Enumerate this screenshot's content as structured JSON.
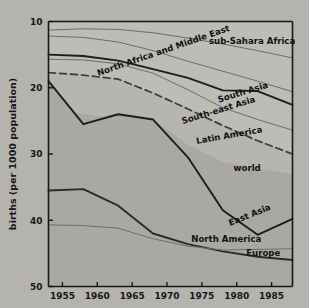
{
  "chart_data": {
    "type": "line",
    "title": "",
    "xlabel": "",
    "ylabel": "births (per 1000 population)",
    "xlim": [
      1953,
      1988
    ],
    "ylim": [
      10,
      50
    ],
    "xticks": [
      1955,
      1960,
      1965,
      1970,
      1975,
      1980,
      1985
    ],
    "yticks": [
      10,
      20,
      30,
      40,
      50
    ],
    "grid": false,
    "legend_position": "inline-right-labels",
    "background_color": "#b4b3ae",
    "plot_background_color": "#bdbcb7",
    "band_fill_color": "#a8a7a2",
    "band_fill_color_light": "#b3b2ad",
    "line_color_dark": "#1d1d20",
    "line_color_light": "#6e6d69",
    "x": [
      1953,
      1958,
      1963,
      1968,
      1973,
      1978,
      1983,
      1988
    ],
    "series": [
      {
        "name": "sub-Sahara Africa",
        "label": "sub-Sahara Africa",
        "style": "thin-solid",
        "color": "#6e6d69",
        "values": [
          48.7,
          48.9,
          48.8,
          48.3,
          47.5,
          46.6,
          45.6,
          44.5
        ],
        "label_x": 1982.2,
        "label_y": 46.6,
        "label_rotate": 0
      },
      {
        "name": "North Africa and Middle East",
        "label": "North Africa and Middle East",
        "style": "thin-solid",
        "color": "#6e6d69",
        "values": [
          47.8,
          47.6,
          46.9,
          45.6,
          44.0,
          42.5,
          41.0,
          39.4
        ],
        "label_x": 1969.6,
        "label_y": 45.2,
        "label_rotate": -19
      },
      {
        "name": "South Asia",
        "label": "South Asia",
        "style": "thick-solid",
        "color": "#1d1d20",
        "values": [
          45.0,
          44.8,
          44.1,
          42.8,
          41.5,
          39.6,
          39.5,
          37.4
        ],
        "label_x": 1981.0,
        "label_y": 38.9,
        "label_rotate": -17
      },
      {
        "name": "South-east Asia",
        "label": "South-east Asia",
        "style": "thin-solid",
        "color": "#6e6d69",
        "values": [
          44.3,
          44.2,
          43.6,
          42.2,
          39.7,
          37.0,
          35.2,
          33.6
        ],
        "label_x": 1977.5,
        "label_y": 36.2,
        "label_rotate": -17
      },
      {
        "name": "Latin America",
        "label": "Latin America",
        "style": "dashed",
        "color": "#3a3a3d",
        "values": [
          42.3,
          41.9,
          41.3,
          39.2,
          36.8,
          34.3,
          32.0,
          30.0
        ],
        "label_x": 1979.0,
        "label_y": 32.4,
        "label_rotate": -10
      },
      {
        "name": "world",
        "label": "world",
        "style": "band",
        "color": "#a8a7a2",
        "values": [
          37.3,
          36.0,
          35.4,
          33.8,
          31.4,
          28.8,
          27.8,
          27.0
        ],
        "label_x": 1981.5,
        "label_y": 27.4,
        "label_rotate": 0
      },
      {
        "name": "East Asia",
        "label": "East Asia",
        "style": "thick-solid",
        "color": "#1d1d20",
        "values": [
          41.0,
          34.5,
          36.0,
          35.2,
          29.5,
          21.5,
          17.8,
          20.2
        ],
        "label_x": 1982.0,
        "label_y": 20.4,
        "label_rotate": -22
      },
      {
        "name": "North America",
        "label": "North America",
        "style": "thick-solid",
        "color": "#2a2a2d",
        "values": [
          24.5,
          24.7,
          22.2,
          18.0,
          16.4,
          15.3,
          14.5,
          14.0
        ],
        "label_x": 1978.5,
        "label_y": 16.7,
        "label_rotate": 0
      },
      {
        "name": "Europe",
        "label": "Europe",
        "style": "thin-solid",
        "color": "#6e6d69",
        "values": [
          19.3,
          19.2,
          18.8,
          17.2,
          16.1,
          15.5,
          15.6,
          15.7
        ],
        "label_x": 1983.8,
        "label_y": 14.6,
        "label_rotate": 0
      }
    ]
  },
  "axis": {
    "y_axis_title": "births (per 1000 population)",
    "y_tick_labels": [
      "50",
      "40",
      "30",
      "20",
      "10"
    ],
    "x_tick_labels": [
      "1955",
      "1960",
      "1965",
      "1970",
      "1975",
      "1980",
      "1985"
    ]
  }
}
